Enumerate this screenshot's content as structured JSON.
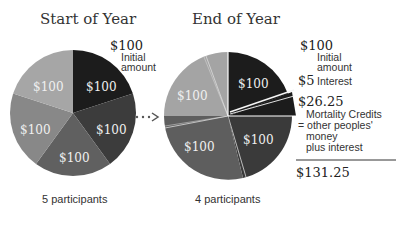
{
  "left": {
    "title": "Start of Year",
    "top_value": "$100",
    "top_note_line1": "Initial",
    "top_note_line2": "amount",
    "slice_labels": [
      "$100",
      "$100",
      "$100",
      "$100",
      "$100"
    ],
    "footer": "5 participants"
  },
  "right": {
    "title": "End of Year",
    "slice_labels": [
      "$100",
      "$100",
      "$100",
      "$100"
    ],
    "footer": "4 participants"
  },
  "legend": {
    "initial_value": "$100",
    "initial_note_line1": "Initial",
    "initial_note_line2": "amount",
    "interest_value": "$5",
    "interest_note": "Interest",
    "credits_value": "$26.25",
    "credits_line1": "Mortality Credits",
    "credits_line2": "= other peoples'",
    "credits_line3": "money",
    "credits_line4": "plus interest",
    "total": "$131.25"
  },
  "colors": {
    "black": "#1a1a1a",
    "dark": "#3a3a3a",
    "mid": "#5e5e5e",
    "light": "#8a8a8a",
    "lighter": "#a8a8a8"
  }
}
